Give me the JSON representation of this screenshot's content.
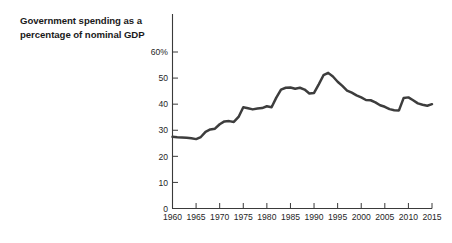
{
  "chart_title_line1": "Government spending as a",
  "chart_title_line2": "percentage of nominal GDP",
  "axis": {
    "y_labels": [
      "60%",
      "50",
      "40",
      "30",
      "20",
      "10",
      "0"
    ],
    "x_labels": [
      "1960",
      "1965",
      "1970",
      "1975",
      "1980",
      "1985",
      "1990",
      "1995",
      "2000",
      "2005",
      "2010",
      "2015"
    ]
  },
  "colors": {
    "line": "#3d3d3d",
    "axis": "#3a3a3a",
    "text": "#1a1a1a"
  },
  "chart_data": {
    "type": "line",
    "title": "Government spending as a percentage of nominal GDP",
    "subtitle": "",
    "xlabel": "",
    "ylabel": "",
    "xlim": [
      1960,
      2015
    ],
    "ylim": [
      0,
      60
    ],
    "grid": false,
    "legend": "none",
    "y_tick_values": [
      0,
      10,
      20,
      30,
      40,
      50,
      60
    ],
    "y_tick_labels": [
      "0",
      "10",
      "20",
      "30",
      "40",
      "50",
      "60%"
    ],
    "x_tick_values": [
      1960,
      1965,
      1970,
      1975,
      1980,
      1985,
      1990,
      1995,
      2000,
      2005,
      2010,
      2015
    ],
    "series": [
      {
        "name": "Government spending as a percentage of nominal GDP",
        "x": [
          1960,
          1961,
          1962,
          1963,
          1964,
          1965,
          1966,
          1967,
          1968,
          1969,
          1970,
          1971,
          1972,
          1973,
          1974,
          1975,
          1976,
          1977,
          1978,
          1979,
          1980,
          1981,
          1982,
          1983,
          1984,
          1985,
          1986,
          1987,
          1988,
          1989,
          1990,
          1991,
          1992,
          1993,
          1994,
          1995,
          1996,
          1997,
          1998,
          1999,
          2000,
          2001,
          2002,
          2003,
          2004,
          2005,
          2006,
          2007,
          2008,
          2009,
          2010,
          2011,
          2012,
          2013,
          2014,
          2015
        ],
        "values": [
          27.5,
          27.3,
          27.2,
          27.1,
          26.9,
          26.6,
          27.4,
          29.4,
          30.3,
          30.6,
          32.3,
          33.4,
          33.5,
          33.2,
          35.1,
          38.8,
          38.4,
          38.0,
          38.3,
          38.5,
          39.2,
          38.8,
          42.5,
          45.6,
          46.3,
          46.4,
          45.9,
          46.3,
          45.6,
          44.1,
          44.3,
          47.6,
          51.1,
          52.0,
          50.6,
          48.6,
          47.0,
          45.2,
          44.4,
          43.4,
          42.6,
          41.6,
          41.5,
          40.7,
          39.6,
          39.0,
          38.1,
          37.7,
          37.6,
          42.4,
          42.6,
          41.5,
          40.3,
          39.8,
          39.4,
          40.0
        ]
      }
    ]
  }
}
